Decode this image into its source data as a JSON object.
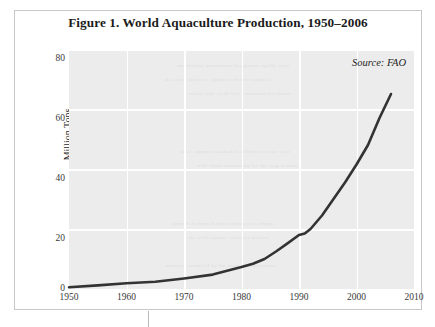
{
  "figure": {
    "title": "Figure 1. World Aquaculture Production, 1950–2006",
    "source_note": "Source: FAO",
    "frame_color": "#c8c8c8",
    "plot_background": "#ececec",
    "gridline_color": "#ffffff",
    "line_color": "#333333"
  },
  "chart_data": {
    "type": "line",
    "title": "Figure 1. World Aquaculture Production, 1950–2006",
    "subtitle": "",
    "xlabel": "",
    "ylabel": "Million Tons",
    "annotation": "Source: FAO",
    "xlim": [
      1950,
      2010
    ],
    "ylim": [
      0,
      80
    ],
    "xticks": [
      "1950",
      "1960",
      "1970",
      "1980",
      "1990",
      "2000",
      "2010"
    ],
    "xtick_values": [
      1950,
      1960,
      1970,
      1980,
      1990,
      2000,
      2010
    ],
    "yticks": [
      "0",
      "20",
      "40",
      "60",
      "80"
    ],
    "ytick_values": [
      0,
      20,
      40,
      60,
      80
    ],
    "grid": "both",
    "legend": "none",
    "series": [
      {
        "name": "World aquaculture production",
        "color": "#333333",
        "x": [
          1950,
          1955,
          1960,
          1965,
          1970,
          1975,
          1980,
          1982,
          1984,
          1986,
          1988,
          1990,
          1991,
          1992,
          1994,
          1996,
          1998,
          2000,
          2002,
          2004,
          2006
        ],
        "values": [
          0.6,
          1.2,
          1.9,
          2.4,
          3.5,
          4.8,
          7.3,
          8.4,
          10.0,
          12.5,
          15.2,
          18.0,
          18.5,
          20.0,
          24.5,
          30.0,
          35.5,
          41.5,
          48.0,
          57.0,
          65.0
        ]
      }
    ]
  },
  "axes": {
    "y_title": "Million Tons"
  }
}
